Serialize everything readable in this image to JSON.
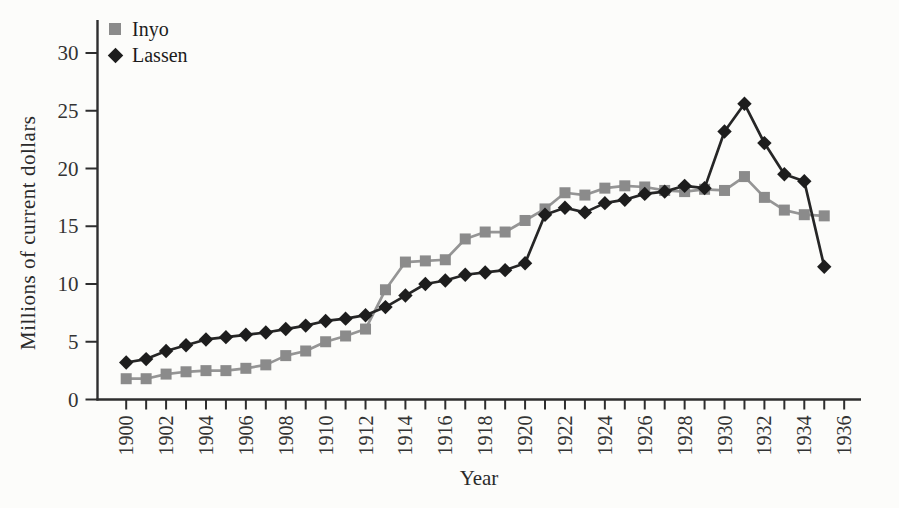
{
  "figure": {
    "background": "#fcfcfa",
    "axis_color": "#2e2e2e",
    "tick_label_color": "#333333"
  },
  "legend": {
    "position": "top-left",
    "items": [
      {
        "label": "Inyo",
        "marker": "square-icon",
        "color": "#8b8b8b"
      },
      {
        "label": "Lassen",
        "marker": "diamond-icon",
        "color": "#1d1d1d"
      }
    ]
  },
  "chart_data": {
    "type": "line",
    "title": "",
    "xlabel": "Year",
    "ylabel": "Millions of current dollars",
    "grid": false,
    "legend_position": "top-left",
    "x_axis_range": [
      1900,
      1936
    ],
    "x_tick_every": 1,
    "x_label_every": 2,
    "ylim": [
      0,
      32.8
    ],
    "y_ticks": [
      0,
      5,
      10,
      15,
      20,
      25,
      30
    ],
    "x": [
      1900,
      1901,
      1902,
      1903,
      1904,
      1905,
      1906,
      1907,
      1908,
      1909,
      1910,
      1911,
      1912,
      1913,
      1914,
      1915,
      1916,
      1917,
      1918,
      1919,
      1920,
      1921,
      1922,
      1923,
      1924,
      1925,
      1926,
      1927,
      1928,
      1929,
      1930,
      1931,
      1932,
      1933,
      1934,
      1935
    ],
    "series": [
      {
        "name": "Inyo",
        "marker": "square",
        "marker_color": "#8b8b8b",
        "line_color": "#959595",
        "values": [
          1.8,
          1.8,
          2.2,
          2.4,
          2.5,
          2.5,
          2.7,
          3.0,
          3.8,
          4.2,
          5.0,
          5.5,
          6.1,
          9.5,
          11.9,
          12.0,
          12.1,
          13.9,
          14.5,
          14.5,
          15.5,
          16.5,
          17.9,
          17.7,
          18.3,
          18.5,
          18.4,
          18.1,
          18.0,
          18.2,
          18.1,
          19.3,
          17.5,
          16.4,
          16.0,
          15.9
        ]
      },
      {
        "name": "Lassen",
        "marker": "diamond",
        "marker_color": "#1d1d1d",
        "line_color": "#262626",
        "values": [
          3.2,
          3.5,
          4.2,
          4.7,
          5.2,
          5.4,
          5.6,
          5.8,
          6.1,
          6.4,
          6.8,
          7.0,
          7.3,
          8.0,
          9.0,
          10.0,
          10.3,
          10.8,
          11.0,
          11.2,
          11.8,
          16.0,
          16.6,
          16.2,
          17.0,
          17.3,
          17.8,
          18.0,
          18.5,
          18.3,
          23.2,
          25.6,
          22.2,
          19.5,
          18.9,
          11.5
        ]
      }
    ]
  }
}
